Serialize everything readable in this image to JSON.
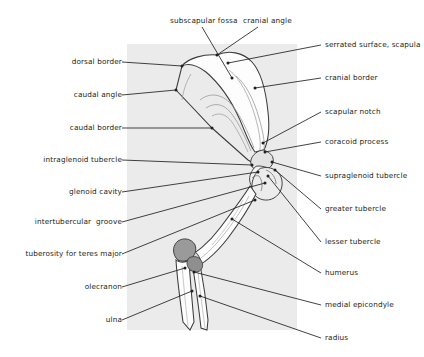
{
  "figure": {
    "panel_color": "#ebebeb",
    "line_color": "#231f20",
    "bone_outline_color": "#3b3b3b",
    "bone_fill_color": "#fdfdfd",
    "shading_color": "#9a9a9a"
  },
  "labels_left": [
    {
      "text": "dorsal border",
      "x": 54,
      "y": 58,
      "width": 68,
      "anchor_x": 122,
      "anchor_y": 62,
      "point_x": 182,
      "point_y": 66
    },
    {
      "text": "caudal angle",
      "x": 57,
      "y": 91,
      "width": 65,
      "anchor_x": 122,
      "anchor_y": 95,
      "point_x": 176,
      "point_y": 90
    },
    {
      "text": "caudal border",
      "x": 52,
      "y": 124,
      "width": 70,
      "anchor_x": 122,
      "anchor_y": 128,
      "point_x": 212,
      "point_y": 128
    },
    {
      "text": "intraglenoid tubercle",
      "x": 29,
      "y": 156,
      "width": 93,
      "anchor_x": 122,
      "anchor_y": 160,
      "point_x": 252,
      "point_y": 165
    },
    {
      "text": "glenoid cavity",
      "x": 53,
      "y": 188,
      "width": 69,
      "anchor_x": 122,
      "anchor_y": 192,
      "point_x": 258,
      "point_y": 172
    },
    {
      "text": "intertubercular  groove",
      "x": 20,
      "y": 218,
      "width": 102,
      "anchor_x": 122,
      "anchor_y": 222,
      "point_x": 265,
      "point_y": 183
    },
    {
      "text": "tuberosity for teres major",
      "x": 12,
      "y": 250,
      "width": 110,
      "anchor_x": 122,
      "anchor_y": 254,
      "point_x": 255,
      "point_y": 200
    },
    {
      "text": "olecranon",
      "x": 67,
      "y": 283,
      "width": 55,
      "anchor_x": 122,
      "anchor_y": 287,
      "point_x": 185,
      "point_y": 268
    },
    {
      "text": "ulna",
      "x": 90,
      "y": 316,
      "width": 32,
      "anchor_x": 122,
      "anchor_y": 320,
      "point_x": 192,
      "point_y": 291
    }
  ],
  "labels_right": [
    {
      "text": "serrated surface, scapula",
      "x": 325,
      "y": 41,
      "anchor_x": 321,
      "anchor_y": 45,
      "point_x": 228,
      "point_y": 63
    },
    {
      "text": "cranial border",
      "x": 325,
      "y": 74,
      "anchor_x": 321,
      "anchor_y": 78,
      "point_x": 255,
      "point_y": 88
    },
    {
      "text": "scapular notch",
      "x": 325,
      "y": 108,
      "anchor_x": 321,
      "anchor_y": 112,
      "point_x": 263,
      "point_y": 143
    },
    {
      "text": "coracoid process",
      "x": 325,
      "y": 138,
      "anchor_x": 321,
      "anchor_y": 142,
      "point_x": 265,
      "point_y": 152
    },
    {
      "text": "supraglenoid tubercle",
      "x": 325,
      "y": 172,
      "anchor_x": 321,
      "anchor_y": 176,
      "point_x": 272,
      "point_y": 162
    },
    {
      "text": "greater tubercle",
      "x": 325,
      "y": 205,
      "anchor_x": 321,
      "anchor_y": 209,
      "point_x": 275,
      "point_y": 170
    },
    {
      "text": "lesser tubercle",
      "x": 325,
      "y": 238,
      "anchor_x": 321,
      "anchor_y": 242,
      "point_x": 268,
      "point_y": 176
    },
    {
      "text": "humerus",
      "x": 325,
      "y": 269,
      "anchor_x": 321,
      "anchor_y": 273,
      "point_x": 232,
      "point_y": 219
    },
    {
      "text": "medial epicondyle",
      "x": 325,
      "y": 301,
      "anchor_x": 321,
      "anchor_y": 305,
      "point_x": 194,
      "point_y": 272
    },
    {
      "text": "radius",
      "x": 325,
      "y": 334,
      "anchor_x": 321,
      "anchor_y": 338,
      "point_x": 200,
      "point_y": 296
    }
  ],
  "labels_top": [
    {
      "text": "subscapular fossa",
      "x": 170,
      "y": 17,
      "anchor_x": 202,
      "anchor_y": 27,
      "point_x": 232,
      "point_y": 78
    },
    {
      "text": "cranial angle",
      "x": 243,
      "y": 17,
      "anchor_x": 258,
      "anchor_y": 27,
      "point_x": 217,
      "point_y": 55
    }
  ]
}
